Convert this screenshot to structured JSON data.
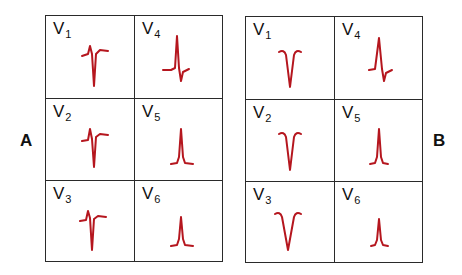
{
  "panels": {
    "A": {
      "label": "A",
      "leads": [
        {
          "name": "V",
          "sub": "1",
          "wave": "M36 40 L42 38 L44 30 L46 38 L48 70 L50 38 L54 34 L62 35"
        },
        {
          "name": "V",
          "sub": "4",
          "wave": "M28 54 L36 54 L40 52 L42 20 L44 52 L46 65 L48 56 L54 53"
        },
        {
          "name": "V",
          "sub": "2",
          "wave": "M36 42 L42 41 L44 30 L46 40 L48 68 L50 38 L54 35 L62 36"
        },
        {
          "name": "V",
          "sub": "5",
          "wave": "M36 65 L42 64 L44 58 L46 30 L48 58 L50 64 L58 65"
        },
        {
          "name": "V",
          "sub": "3",
          "wave": "M34 40 L40 39 L42 30 L44 37 L46 69 L48 38 L52 35 L60 36"
        },
        {
          "name": "V",
          "sub": "6",
          "wave": "M36 65 L42 64 L44 58 L46 36 L48 58 L50 64 L58 65"
        }
      ]
    },
    "B": {
      "label": "B",
      "leads": [
        {
          "name": "V",
          "sub": "1",
          "wave": "M33 35 Q38 32 40 38 L44 70 L48 38 Q50 32 55 35"
        },
        {
          "name": "V",
          "sub": "4",
          "wave": "M34 53 L40 52 L44 21 L47 52 L49 64 L51 56 L57 53"
        },
        {
          "name": "V",
          "sub": "2",
          "wave": "M33 34 Q38 31 40 37 L44 70 L48 37 Q50 31 55 34"
        },
        {
          "name": "V",
          "sub": "5",
          "wave": "M35 64 L40 63 L42 57 L44 29 L46 57 L48 63 L53 64"
        },
        {
          "name": "V",
          "sub": "3",
          "wave": "M29 32 Q34 29 36 35 L42 68 L48 35 Q50 29 55 32"
        },
        {
          "name": "V",
          "sub": "6",
          "wave": "M36 64 L40 63 L42 58 L44 37 L46 58 L48 63 L53 64"
        }
      ]
    }
  },
  "colors": {
    "trace": "#b5161e",
    "grid": "#2a2a2a"
  }
}
